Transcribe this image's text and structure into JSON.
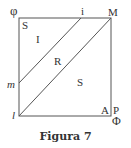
{
  "figure": {
    "caption": "Figura 7",
    "labels": {
      "top_left_outer": "φ",
      "top_left_inner": "S",
      "top_mid": "i",
      "top_right": "M",
      "region_I": "I",
      "region_R": "R",
      "region_S": "S",
      "left_point": "m",
      "bottom_left": "l",
      "bottom_right_inner": "A",
      "bottom_right_outer": "P",
      "bottom_right_below": "Φ"
    },
    "colors": {
      "line": "#555555",
      "text": "#333333"
    },
    "geometry": {
      "square": {
        "x1": 19,
        "y1": 18,
        "x2": 111,
        "y2": 116
      },
      "line_i_m": {
        "from": [
          81,
          18
        ],
        "to": [
          19,
          83
        ]
      },
      "line_diag": {
        "from": [
          19,
          116
        ],
        "to": [
          111,
          18
        ]
      }
    }
  }
}
